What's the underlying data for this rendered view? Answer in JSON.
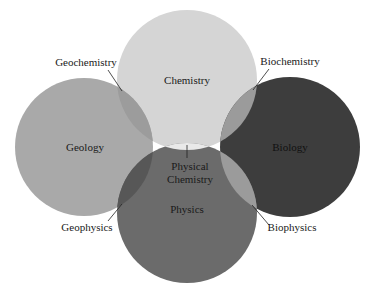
{
  "diagram": {
    "type": "venn",
    "title": "",
    "circles": [
      {
        "id": "chemistry",
        "label": "Chemistry",
        "cx": 187,
        "cy": 80,
        "r": 70,
        "color": "#d5d5d5",
        "label_x": 187,
        "label_y": 84
      },
      {
        "id": "geology",
        "label": "Geology",
        "cx": 84,
        "cy": 147,
        "r": 69,
        "color": "#a9a9a9",
        "label_x": 85,
        "label_y": 151
      },
      {
        "id": "biology",
        "label": "Biology",
        "cx": 290,
        "cy": 147,
        "r": 70,
        "color": "#3d3d3d",
        "label_x": 290,
        "label_y": 151
      },
      {
        "id": "physics",
        "label": "Physics",
        "cx": 187,
        "cy": 213,
        "r": 70,
        "color": "#6b6b6b",
        "label_x": 187,
        "label_y": 213
      }
    ],
    "overlaps": [
      {
        "id": "geochemistry",
        "label": "Geochemistry",
        "between": [
          "geology",
          "chemistry"
        ],
        "color": "#9c9c9c",
        "label_x": 86,
        "label_y": 66,
        "leader": [
          108,
          70,
          122,
          91
        ]
      },
      {
        "id": "biochemistry",
        "label": "Biochemistry",
        "between": [
          "biology",
          "chemistry"
        ],
        "color": "#9b9b9b",
        "label_x": 290,
        "label_y": 65,
        "leader": [
          269,
          69,
          253,
          90
        ]
      },
      {
        "id": "geophysics",
        "label": "Geophysics",
        "between": [
          "geology",
          "physics"
        ],
        "color": "#575757",
        "label_x": 87,
        "label_y": 231,
        "leader": [
          108,
          221,
          122,
          204
        ]
      },
      {
        "id": "biophysics",
        "label": "Biophysics",
        "between": [
          "biology",
          "physics"
        ],
        "color": "#9b9b9b",
        "label_x": 292,
        "label_y": 231,
        "leader": [
          269,
          225,
          252,
          205
        ]
      },
      {
        "id": "physical-chemistry",
        "label_lines": [
          "Physical",
          "Chemistry"
        ],
        "between": [
          "chemistry",
          "physics"
        ],
        "color": "#e9e9e9",
        "label_x": 190,
        "label_y": 169,
        "leader": [
          187,
          145,
          187,
          158
        ]
      }
    ]
  }
}
